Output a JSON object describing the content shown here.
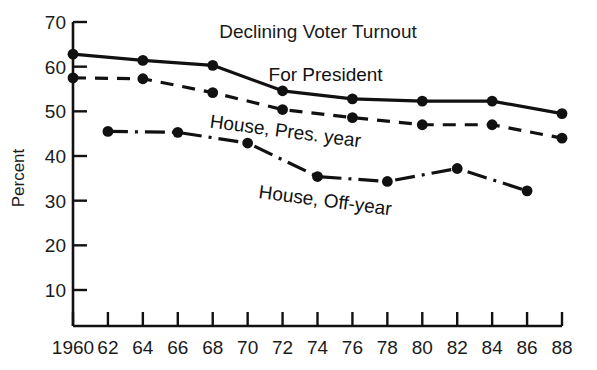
{
  "chart_data": {
    "type": "line",
    "title": "Declining Voter Turnout",
    "xlabel": "",
    "ylabel": "Percent",
    "xlim": [
      1960,
      1988
    ],
    "ylim": [
      0,
      70
    ],
    "grid": false,
    "legend_position": "inline-annotations",
    "x_tick_labels": [
      "1960",
      "62",
      "64",
      "66",
      "68",
      "70",
      "72",
      "74",
      "76",
      "78",
      "80",
      "82",
      "84",
      "86",
      "88"
    ],
    "x_tick_values": [
      1960,
      1962,
      1964,
      1966,
      1968,
      1970,
      1972,
      1974,
      1976,
      1978,
      1980,
      1982,
      1984,
      1986,
      1988
    ],
    "y_tick_labels": [
      "10",
      "20",
      "30",
      "40",
      "50",
      "60",
      "70"
    ],
    "y_tick_values": [
      10,
      20,
      30,
      40,
      50,
      60,
      70
    ],
    "series": [
      {
        "name": "For President",
        "style": "solid",
        "color": "#111111",
        "x": [
          1960,
          1964,
          1968,
          1972,
          1976,
          1980,
          1984,
          1988
        ],
        "values": [
          62.8,
          61.4,
          60.3,
          54.6,
          52.8,
          52.3,
          52.3,
          49.5
        ]
      },
      {
        "name": "House, Pres. year",
        "style": "dashed",
        "color": "#111111",
        "x": [
          1960,
          1964,
          1968,
          1972,
          1976,
          1980,
          1984,
          1988
        ],
        "values": [
          57.5,
          57.3,
          54.2,
          50.4,
          48.6,
          47.0,
          47.0,
          44.0
        ]
      },
      {
        "name": "House, Off-year",
        "style": "dash-dot",
        "color": "#111111",
        "x": [
          1962,
          1966,
          1970,
          1974,
          1978,
          1982,
          1986
        ],
        "values": [
          45.5,
          45.3,
          42.9,
          35.4,
          34.3,
          37.2,
          32.2
        ]
      }
    ],
    "annotations": [
      {
        "text": "For President",
        "x": 1971.2,
        "y": 56.9,
        "rotation": 0
      },
      {
        "text": "House, Pres. year",
        "x": 1967.8,
        "y": 46.4,
        "rotation": 7.5
      },
      {
        "text": "House, Off-year",
        "x": 1970.6,
        "y": 30.6,
        "rotation": 7.5
      }
    ]
  }
}
